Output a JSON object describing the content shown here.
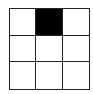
{
  "grid": {
    "rows": 3,
    "cols": 3,
    "filled_color": "#000000",
    "empty_color": "#ffffff",
    "line_color": "#222222",
    "cells": [
      [
        false,
        true,
        false
      ],
      [
        false,
        false,
        false
      ],
      [
        false,
        false,
        false
      ]
    ]
  }
}
